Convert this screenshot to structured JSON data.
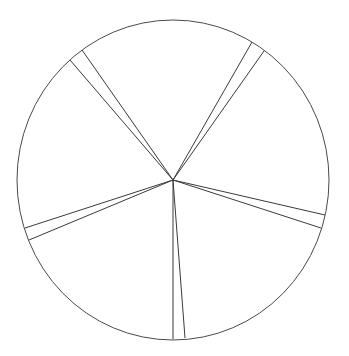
{
  "chart_data": {
    "type": "pie",
    "title": "",
    "legend": [],
    "center": [
      173,
      180
    ],
    "radius": [
      156,
      160
    ],
    "colors": {
      "stroke": "#444444",
      "fill": "#ffffff"
    },
    "slices": [
      {
        "label": "",
        "value": 64,
        "kind": "segment"
      },
      {
        "label": "",
        "value": 4.5,
        "kind": "gap"
      },
      {
        "label": "",
        "value": 73,
        "kind": "segment"
      },
      {
        "label": "",
        "value": 4.5,
        "kind": "gap"
      },
      {
        "label": "",
        "value": 74,
        "kind": "segment"
      },
      {
        "label": "",
        "value": 4.5,
        "kind": "gap"
      },
      {
        "label": "",
        "value": 70,
        "kind": "segment"
      },
      {
        "label": "",
        "value": 4.5,
        "kind": "gap"
      },
      {
        "label": "",
        "value": 63,
        "kind": "segment"
      },
      {
        "label": "",
        "value": 4.5,
        "kind": "gap"
      }
    ],
    "spoke_endpoints": [
      [
        252,
        42
      ],
      [
        264,
        51
      ],
      [
        325,
        215
      ],
      [
        321,
        228
      ],
      [
        185,
        338
      ],
      [
        173,
        339
      ],
      [
        29,
        240
      ],
      [
        25,
        228
      ],
      [
        70,
        60
      ],
      [
        82,
        50
      ]
    ]
  }
}
